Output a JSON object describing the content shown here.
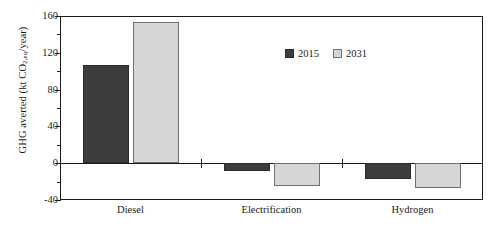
{
  "chart_data": {
    "type": "bar",
    "title": "",
    "xlabel": "",
    "ylabel_parts": {
      "pre": "GHG averted (kt CO",
      "sub": "2,eq",
      "post": "/year)"
    },
    "ylabel": "GHG averted (kt CO2,eq/year)",
    "categories": [
      "Diesel",
      "Electrification",
      "Hydrogen"
    ],
    "series": [
      {
        "name": "2015",
        "color": "#3c3c3c",
        "values": [
          107,
          -8,
          -17
        ]
      },
      {
        "name": "2031",
        "color": "#d6d6d6",
        "values": [
          153,
          -25,
          -27
        ]
      }
    ],
    "ylim": [
      -40,
      160
    ],
    "yticks": [
      160,
      120,
      80,
      40,
      0,
      -40
    ],
    "yticklabels": [
      "160",
      "120",
      "80",
      "40",
      "0",
      "-40"
    ],
    "minor_yticks": [
      140,
      100,
      60,
      20,
      -20
    ],
    "grid": false,
    "legend_position": "upper-center-right",
    "zero_line": 0
  },
  "legend": {
    "items": [
      {
        "label": "2015",
        "swatch": "dark-square-swatch"
      },
      {
        "label": "2031",
        "swatch": "light-square-swatch"
      }
    ]
  }
}
